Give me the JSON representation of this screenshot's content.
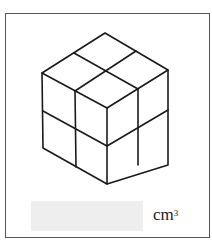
{
  "figure": {
    "cubes_per_edge": 2
  },
  "answer": {
    "value": "",
    "placeholder": "",
    "unit_base": "cm",
    "unit_exponent": "3"
  }
}
